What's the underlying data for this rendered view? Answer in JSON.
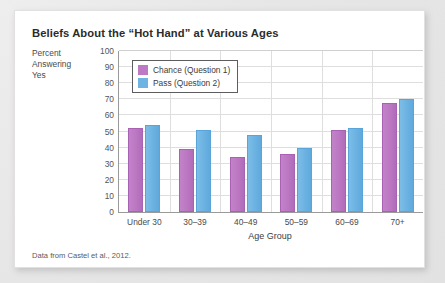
{
  "figure": {
    "title": "Beliefs About the “Hot Hand” at Various Ages",
    "y_caption_line1": "Percent",
    "y_caption_line2": "Answering",
    "y_caption_line3": "Yes",
    "source_note": "Data from Castel et al., 2012."
  },
  "colors": {
    "chance": "#bd79c4",
    "pass": "#6eb4e3",
    "axis": "#9a9a9a",
    "grid": "#dedede",
    "card_background": "#ffffff",
    "page_background": "#eceaea"
  },
  "chart_data": {
    "type": "bar",
    "title": "Beliefs About the “Hot Hand” at Various Ages",
    "subtitle": "",
    "xlabel": "Age Group",
    "ylabel": "Percent Answering Yes",
    "ylim": [
      0,
      100
    ],
    "ytick_step": 10,
    "yticks": [
      0,
      10,
      20,
      30,
      40,
      50,
      60,
      70,
      80,
      90,
      100
    ],
    "ytick_labels": [
      "0",
      "10",
      "20",
      "30",
      "40",
      "50",
      "60",
      "70",
      "80",
      "90",
      "100"
    ],
    "grid": "horizontal-and-group-separators",
    "legend_position": "upper-left-inside",
    "categories": [
      "Under 30",
      "30–39",
      "40–49",
      "50–59",
      "60–69",
      "70+"
    ],
    "series": [
      {
        "name": "Chance (Question 1)",
        "color": "#bd79c4",
        "values": [
          52,
          39,
          34,
          36,
          51,
          68
        ]
      },
      {
        "name": "Pass (Question 2)",
        "color": "#6eb4e3",
        "values": [
          54,
          51,
          48,
          40,
          52,
          70.5
        ]
      }
    ],
    "annotations": [
      "Data from Castel et al., 2012."
    ]
  }
}
